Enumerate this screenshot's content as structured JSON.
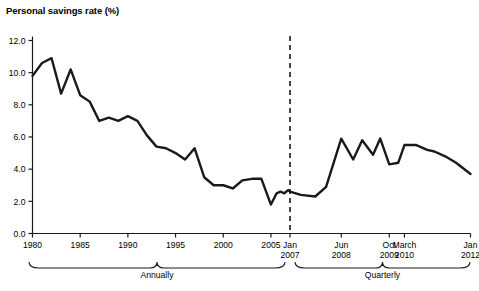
{
  "chart_data": {
    "type": "line",
    "title": "Personal savings rate (%)",
    "xlabel": "",
    "ylabel": "",
    "ylim": [
      0.0,
      12.0
    ],
    "y_ticks": [
      "0.0",
      "2.0",
      "4.0",
      "6.0",
      "8.0",
      "10.0",
      "12.0"
    ],
    "y_tick_values": [
      0.0,
      2.0,
      4.0,
      6.0,
      8.0,
      10.0,
      12.0
    ],
    "grid": false,
    "legend": null,
    "line_color": "#1a1a1a",
    "axis_color": "#1a1a1a",
    "x_ticks": [
      {
        "label": "1980",
        "sublabel": "",
        "x": 1980
      },
      {
        "label": "1985",
        "sublabel": "",
        "x": 1985
      },
      {
        "label": "1990",
        "sublabel": "",
        "x": 1990
      },
      {
        "label": "1995",
        "sublabel": "",
        "x": 1995
      },
      {
        "label": "2000",
        "sublabel": "",
        "x": 2000
      },
      {
        "label": "2005",
        "sublabel": "",
        "x": 2005
      },
      {
        "label": "Jan",
        "sublabel": "2007",
        "x": 2007.0
      },
      {
        "label": "Jun",
        "sublabel": "2008",
        "x": 2008.42
      },
      {
        "label": "Oct",
        "sublabel": "2009",
        "x": 2009.75
      },
      {
        "label": "March",
        "sublabel": "2010",
        "x": 2010.17
      },
      {
        "label": "Jan",
        "sublabel": "2012",
        "x": 2012.0
      }
    ],
    "annotations": [
      {
        "name": "period-divider",
        "type": "vertical-dashed-line",
        "label": "Jan 2007",
        "x": 2007.0
      },
      {
        "name": "annually-brace",
        "type": "brace",
        "label": "Annually"
      },
      {
        "name": "quarterly-brace",
        "type": "brace",
        "label": "Quarterly"
      }
    ],
    "series": [
      {
        "name": "Personal savings rate",
        "x": [
          1980.0,
          1981.0,
          1982.0,
          1983.0,
          1984.0,
          1985.0,
          1986.0,
          1987.0,
          1988.0,
          1989.0,
          1990.0,
          1991.0,
          1992.0,
          1993.0,
          1994.0,
          1995.0,
          1996.0,
          1997.0,
          1998.0,
          1999.0,
          2000.0,
          2001.0,
          2002.0,
          2003.0,
          2004.0,
          2005.0,
          2005.6,
          2006.0,
          2006.4,
          2006.8,
          2007.0,
          2007.3,
          2007.7,
          2008.0,
          2008.42,
          2008.75,
          2009.0,
          2009.3,
          2009.5,
          2009.75,
          2010.0,
          2010.17,
          2010.5,
          2010.8,
          2011.0,
          2011.3,
          2011.6,
          2012.0
        ],
        "values": [
          9.8,
          10.6,
          10.9,
          8.7,
          10.2,
          8.6,
          8.2,
          7.0,
          7.2,
          7.0,
          7.3,
          7.0,
          6.1,
          5.4,
          5.3,
          5.0,
          4.6,
          5.3,
          3.5,
          3.0,
          3.0,
          2.8,
          3.3,
          3.4,
          3.4,
          1.8,
          2.5,
          2.6,
          2.5,
          2.7,
          2.6,
          2.4,
          2.3,
          2.9,
          5.9,
          4.6,
          5.8,
          4.9,
          5.9,
          4.3,
          4.4,
          5.5,
          5.5,
          5.2,
          5.1,
          4.8,
          4.4,
          3.7
        ]
      }
    ],
    "x_range": [
      1980.0,
      2012.0
    ]
  },
  "braces": {
    "annually": "Annually",
    "quarterly": "Quarterly"
  }
}
